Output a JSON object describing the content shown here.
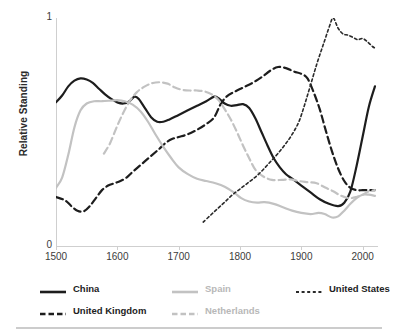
{
  "chart_data": {
    "type": "line",
    "title": "",
    "xlabel": "",
    "ylabel": "Relative Standing",
    "xlim": [
      1500,
      2025
    ],
    "ylim": [
      0,
      1
    ],
    "grid": false,
    "legend_position": "bottom",
    "x_ticks": [
      "1500",
      "1600",
      "1700",
      "1800",
      "1900",
      "2000"
    ],
    "y_ticks": [
      "0",
      "1"
    ],
    "series": [
      {
        "name": "China",
        "color": "#1d1d1d",
        "style": "solid",
        "points": [
          [
            1500,
            0.63
          ],
          [
            1510,
            0.66
          ],
          [
            1520,
            0.7
          ],
          [
            1530,
            0.725
          ],
          [
            1540,
            0.735
          ],
          [
            1550,
            0.73
          ],
          [
            1560,
            0.715
          ],
          [
            1570,
            0.69
          ],
          [
            1580,
            0.665
          ],
          [
            1590,
            0.645
          ],
          [
            1600,
            0.63
          ],
          [
            1610,
            0.625
          ],
          [
            1620,
            0.635
          ],
          [
            1628,
            0.655
          ],
          [
            1635,
            0.645
          ],
          [
            1645,
            0.605
          ],
          [
            1655,
            0.565
          ],
          [
            1665,
            0.545
          ],
          [
            1675,
            0.545
          ],
          [
            1685,
            0.555
          ],
          [
            1700,
            0.575
          ],
          [
            1715,
            0.595
          ],
          [
            1730,
            0.615
          ],
          [
            1745,
            0.635
          ],
          [
            1758,
            0.655
          ],
          [
            1765,
            0.648
          ],
          [
            1775,
            0.625
          ],
          [
            1785,
            0.615
          ],
          [
            1795,
            0.618
          ],
          [
            1805,
            0.622
          ],
          [
            1815,
            0.605
          ],
          [
            1825,
            0.56
          ],
          [
            1835,
            0.5
          ],
          [
            1845,
            0.44
          ],
          [
            1855,
            0.385
          ],
          [
            1865,
            0.345
          ],
          [
            1875,
            0.315
          ],
          [
            1885,
            0.295
          ],
          [
            1900,
            0.265
          ],
          [
            1915,
            0.235
          ],
          [
            1930,
            0.205
          ],
          [
            1945,
            0.185
          ],
          [
            1960,
            0.175
          ],
          [
            1970,
            0.19
          ],
          [
            1980,
            0.24
          ],
          [
            1990,
            0.35
          ],
          [
            2000,
            0.48
          ],
          [
            2010,
            0.61
          ],
          [
            2020,
            0.7
          ]
        ]
      },
      {
        "name": "United Kingdom",
        "color": "#1d1d1d",
        "style": "dashed",
        "points": [
          [
            1500,
            0.215
          ],
          [
            1515,
            0.2
          ],
          [
            1525,
            0.175
          ],
          [
            1535,
            0.155
          ],
          [
            1545,
            0.152
          ],
          [
            1555,
            0.175
          ],
          [
            1565,
            0.21
          ],
          [
            1575,
            0.245
          ],
          [
            1585,
            0.265
          ],
          [
            1595,
            0.275
          ],
          [
            1605,
            0.285
          ],
          [
            1615,
            0.3
          ],
          [
            1625,
            0.325
          ],
          [
            1640,
            0.36
          ],
          [
            1655,
            0.395
          ],
          [
            1668,
            0.425
          ],
          [
            1680,
            0.455
          ],
          [
            1690,
            0.47
          ],
          [
            1700,
            0.478
          ],
          [
            1715,
            0.49
          ],
          [
            1730,
            0.51
          ],
          [
            1745,
            0.535
          ],
          [
            1758,
            0.565
          ],
          [
            1768,
            0.62
          ],
          [
            1778,
            0.655
          ],
          [
            1790,
            0.675
          ],
          [
            1805,
            0.695
          ],
          [
            1820,
            0.715
          ],
          [
            1835,
            0.74
          ],
          [
            1850,
            0.77
          ],
          [
            1862,
            0.785
          ],
          [
            1875,
            0.78
          ],
          [
            1888,
            0.765
          ],
          [
            1900,
            0.755
          ],
          [
            1910,
            0.735
          ],
          [
            1920,
            0.675
          ],
          [
            1930,
            0.6
          ],
          [
            1940,
            0.505
          ],
          [
            1950,
            0.415
          ],
          [
            1960,
            0.34
          ],
          [
            1970,
            0.285
          ],
          [
            1980,
            0.255
          ],
          [
            1990,
            0.245
          ],
          [
            2000,
            0.245
          ],
          [
            2010,
            0.245
          ],
          [
            2020,
            0.245
          ]
        ]
      },
      {
        "name": "Spain",
        "color": "#c2c2c2",
        "style": "solid",
        "points": [
          [
            1500,
            0.255
          ],
          [
            1510,
            0.3
          ],
          [
            1520,
            0.4
          ],
          [
            1530,
            0.52
          ],
          [
            1540,
            0.595
          ],
          [
            1550,
            0.625
          ],
          [
            1562,
            0.635
          ],
          [
            1575,
            0.635
          ],
          [
            1590,
            0.638
          ],
          [
            1600,
            0.64
          ],
          [
            1612,
            0.635
          ],
          [
            1625,
            0.62
          ],
          [
            1638,
            0.59
          ],
          [
            1650,
            0.545
          ],
          [
            1662,
            0.49
          ],
          [
            1675,
            0.435
          ],
          [
            1688,
            0.385
          ],
          [
            1700,
            0.345
          ],
          [
            1715,
            0.315
          ],
          [
            1730,
            0.295
          ],
          [
            1745,
            0.285
          ],
          [
            1760,
            0.275
          ],
          [
            1775,
            0.26
          ],
          [
            1790,
            0.235
          ],
          [
            1802,
            0.21
          ],
          [
            1815,
            0.195
          ],
          [
            1828,
            0.19
          ],
          [
            1840,
            0.192
          ],
          [
            1855,
            0.185
          ],
          [
            1870,
            0.17
          ],
          [
            1885,
            0.155
          ],
          [
            1900,
            0.145
          ],
          [
            1915,
            0.14
          ],
          [
            1928,
            0.145
          ],
          [
            1938,
            0.14
          ],
          [
            1950,
            0.125
          ],
          [
            1960,
            0.13
          ],
          [
            1970,
            0.155
          ],
          [
            1980,
            0.185
          ],
          [
            1990,
            0.21
          ],
          [
            2000,
            0.225
          ],
          [
            2010,
            0.225
          ],
          [
            2020,
            0.22
          ]
        ]
      },
      {
        "name": "Netherlands",
        "color": "#c2c2c2",
        "style": "dashed",
        "points": [
          [
            1578,
            0.405
          ],
          [
            1588,
            0.45
          ],
          [
            1598,
            0.515
          ],
          [
            1608,
            0.575
          ],
          [
            1620,
            0.635
          ],
          [
            1632,
            0.675
          ],
          [
            1645,
            0.7
          ],
          [
            1658,
            0.715
          ],
          [
            1670,
            0.718
          ],
          [
            1682,
            0.712
          ],
          [
            1694,
            0.695
          ],
          [
            1706,
            0.685
          ],
          [
            1718,
            0.682
          ],
          [
            1730,
            0.682
          ],
          [
            1742,
            0.678
          ],
          [
            1754,
            0.665
          ],
          [
            1765,
            0.64
          ],
          [
            1775,
            0.6
          ],
          [
            1785,
            0.555
          ],
          [
            1795,
            0.5
          ],
          [
            1805,
            0.44
          ],
          [
            1815,
            0.385
          ],
          [
            1825,
            0.335
          ],
          [
            1838,
            0.305
          ],
          [
            1852,
            0.29
          ],
          [
            1868,
            0.29
          ],
          [
            1882,
            0.292
          ],
          [
            1896,
            0.285
          ],
          [
            1910,
            0.28
          ],
          [
            1925,
            0.275
          ],
          [
            1940,
            0.255
          ],
          [
            1952,
            0.24
          ],
          [
            1965,
            0.22
          ],
          [
            1978,
            0.21
          ],
          [
            1990,
            0.215
          ],
          [
            2000,
            0.225
          ],
          [
            2010,
            0.24
          ],
          [
            2020,
            0.245
          ]
        ]
      },
      {
        "name": "United States",
        "color": "#2a2a2a",
        "style": "dotted",
        "points": [
          [
            1740,
            0.105
          ],
          [
            1752,
            0.135
          ],
          [
            1764,
            0.165
          ],
          [
            1776,
            0.195
          ],
          [
            1788,
            0.225
          ],
          [
            1800,
            0.25
          ],
          [
            1812,
            0.275
          ],
          [
            1824,
            0.3
          ],
          [
            1836,
            0.33
          ],
          [
            1848,
            0.365
          ],
          [
            1860,
            0.4
          ],
          [
            1872,
            0.44
          ],
          [
            1884,
            0.485
          ],
          [
            1896,
            0.545
          ],
          [
            1906,
            0.625
          ],
          [
            1916,
            0.715
          ],
          [
            1926,
            0.805
          ],
          [
            1936,
            0.885
          ],
          [
            1946,
            0.965
          ],
          [
            1952,
            1.0
          ],
          [
            1960,
            0.955
          ],
          [
            1968,
            0.93
          ],
          [
            1976,
            0.925
          ],
          [
            1984,
            0.915
          ],
          [
            1992,
            0.905
          ],
          [
            2000,
            0.91
          ],
          [
            2008,
            0.895
          ],
          [
            2016,
            0.875
          ],
          [
            2022,
            0.865
          ]
        ]
      }
    ]
  },
  "axis": {
    "y_title": "Relative Standing",
    "y_tick_top": "1",
    "y_tick_bottom": "0",
    "x_ticks": [
      {
        "label": "1500",
        "value": 1500
      },
      {
        "label": "1600",
        "value": 1600
      },
      {
        "label": "1700",
        "value": 1700
      },
      {
        "label": "1800",
        "value": 1800
      },
      {
        "label": "1900",
        "value": 1900
      },
      {
        "label": "2000",
        "value": 2000
      }
    ]
  },
  "legend": {
    "items": [
      {
        "id": "china",
        "label": "China",
        "color": "#1d1d1d",
        "style": "solid",
        "muted": false
      },
      {
        "id": "uk",
        "label": "United Kingdom",
        "color": "#1d1d1d",
        "style": "dashed",
        "muted": false
      },
      {
        "id": "spain",
        "label": "Spain",
        "color": "#c2c2c2",
        "style": "solid",
        "muted": true
      },
      {
        "id": "netherlands",
        "label": "Netherlands",
        "color": "#c2c2c2",
        "style": "dashed",
        "muted": true
      },
      {
        "id": "us",
        "label": "United States",
        "color": "#2a2a2a",
        "style": "dotted",
        "muted": false
      }
    ]
  },
  "colors": {
    "dark": "#1d1d1d",
    "light": "#c2c2c2",
    "axis": "#cfcfcf",
    "text": "#333333",
    "rule": "#cccccc"
  },
  "title_sliver": ""
}
